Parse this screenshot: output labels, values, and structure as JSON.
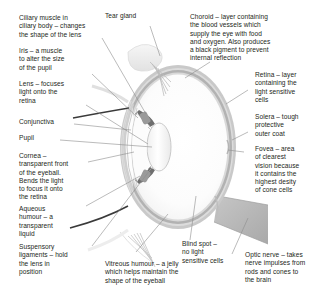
{
  "diagram": {
    "colors": {
      "text": "#231f20",
      "leader_line": "#8d8d8d",
      "sclera_layer": "#c8c8c8",
      "choroid_layer": "#b0b0b0",
      "retina_layer": "#d8d8d8",
      "vitreous_fill": "#fbfbfb",
      "lens_fill": "#f7f7f7",
      "optic_nerve": "#b9b9b9",
      "tear_gland": "#ececec",
      "background": "#ffffff"
    }
  },
  "labels": {
    "ciliary_muscle": "Ciliary muscle in\nciliary body – changes\nthe shape of the lens",
    "iris": "Iris – a muscle\nto alter the size\nof the pupil",
    "lens": "Lens – focuses\nlight onto the\nretina",
    "conjunctiva": "Conjunctiva",
    "pupil": "Pupil",
    "cornea": "Cornea –\ntransparent front\nof the eyeball.\nBends the light\nto focus it onto\nthe retina",
    "aqueous_humour": "Aqueous\nhumour – a\ntransparent\nliquid",
    "suspensory_ligaments": "Suspensory\nligaments – hold\nthe lens in\nposition",
    "tear_gland": "Tear gland",
    "choroid": "Choroid – layer containing\nthe blood vessels which\nsupply the eye with food\nand oxygen. Also produces\na black pigment to prevent\ninternal reflection",
    "retina": "Retina – layer\ncontaining the\nlight sensitive\ncells",
    "sclera": "Solera – tough\nprotective\nouter coat",
    "fovea": "Fovea – area\nof clearest\nvision because\nit contains the\nhighest desity\nof cone cells",
    "vitreous_humour": "Vitreous humour – a jelly\nwhich helps maintain the\nshape of the eyeball",
    "blind_spot": "Blind spot –\nno light\nsensitive cells",
    "optic_nerve": "Optic nerve – takes\nnerve impulses from\nrods and cones to\nthe brain"
  }
}
